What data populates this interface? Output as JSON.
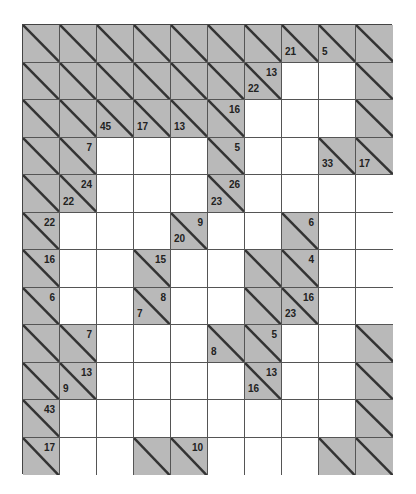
{
  "puzzle": {
    "type": "kakuro",
    "rows": 12,
    "cols": 10,
    "colors": {
      "block": "#b9b9b9",
      "white": "#ffffff",
      "line": "#555555"
    },
    "grid": [
      [
        "X",
        "X",
        "X",
        "X",
        "X",
        "X",
        "X",
        {
          "d": "21"
        },
        {
          "d": "5"
        },
        "X"
      ],
      [
        "X",
        "X",
        "X",
        "X",
        "X",
        "X",
        {
          "d": "22",
          "a": "13"
        },
        "W",
        "W",
        "X"
      ],
      [
        "X",
        "X",
        {
          "d": "45"
        },
        {
          "d": "17"
        },
        {
          "d": "13"
        },
        {
          "a": "16"
        },
        "W",
        "W",
        "W",
        "X"
      ],
      [
        "X",
        {
          "a": "7"
        },
        "W",
        "W",
        "W",
        {
          "a": "5"
        },
        "W",
        "W",
        {
          "d": "33"
        },
        {
          "d": "17"
        }
      ],
      [
        "X",
        {
          "d": "22",
          "a": "24"
        },
        "W",
        "W",
        "W",
        {
          "d": "23",
          "a": "26"
        },
        "W",
        "W",
        "W",
        "W"
      ],
      [
        {
          "a": "22"
        },
        "W",
        "W",
        "W",
        {
          "d": "20",
          "a": "9"
        },
        "W",
        "W",
        {
          "a": "6"
        },
        "W",
        "W"
      ],
      [
        {
          "a": "16"
        },
        "W",
        "W",
        {
          "a": "15"
        },
        "W",
        "W",
        "X",
        {
          "a": "4"
        },
        "W",
        "W"
      ],
      [
        {
          "a": "6"
        },
        "W",
        "W",
        {
          "d": "7",
          "a": "8"
        },
        "W",
        "W",
        "X",
        {
          "d": "23",
          "a": "16"
        },
        "W",
        "W"
      ],
      [
        "X",
        {
          "a": "7"
        },
        "W",
        "W",
        "W",
        {
          "d": "8"
        },
        {
          "a": "5"
        },
        "W",
        "W",
        "X"
      ],
      [
        "X",
        {
          "d": "9",
          "a": "13"
        },
        "W",
        "W",
        "W",
        "W",
        {
          "d": "16",
          "a": "13"
        },
        "W",
        "W",
        "X"
      ],
      [
        {
          "a": "43"
        },
        "W",
        "W",
        "W",
        "W",
        "W",
        "W",
        "W",
        "W",
        "X"
      ],
      [
        {
          "a": "17"
        },
        "W",
        "W",
        "X",
        {
          "a": "10"
        },
        "W",
        "W",
        "W",
        "X",
        "X"
      ]
    ]
  }
}
